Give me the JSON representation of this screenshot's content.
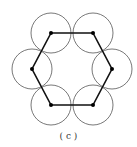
{
  "figure": {
    "caption": "( c )",
    "vertices": [
      [
        51,
        33
      ],
      [
        93,
        33
      ],
      [
        112,
        69
      ],
      [
        93,
        105
      ],
      [
        51,
        105
      ],
      [
        32,
        69
      ]
    ],
    "circle_radius": 20,
    "colors": {
      "hexagon": "#111111",
      "circle": "#555555",
      "vertex": "#000000"
    }
  }
}
